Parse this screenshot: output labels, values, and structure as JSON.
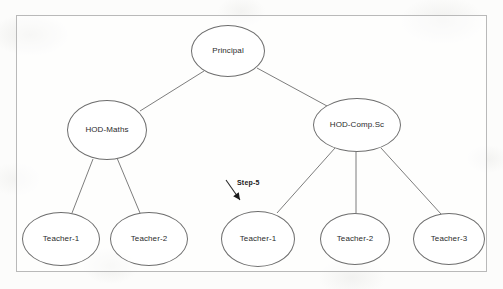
{
  "diagram": {
    "type": "organizational-hierarchy-tree",
    "frame": {
      "border_color": "#b9b9b9"
    },
    "node_style": {
      "stroke": "#6e6e6e",
      "fill": "#ffffff",
      "text_color": "#2b2b2b"
    },
    "edge_style": {
      "stroke": "#6e6e6e"
    },
    "nodes": [
      {
        "id": "principal",
        "label": "Principal",
        "level": 0,
        "cx": 228,
        "cy": 51,
        "rx": 37,
        "ry": 26
      },
      {
        "id": "hod-maths",
        "label": "HOD-Maths",
        "level": 1,
        "cx": 107,
        "cy": 130,
        "rx": 40,
        "ry": 30
      },
      {
        "id": "hod-comp-sc",
        "label": "HOD-Comp.Sc",
        "level": 1,
        "cx": 357,
        "cy": 125,
        "rx": 44,
        "ry": 27
      },
      {
        "id": "maths-teacher-1",
        "label": "Teacher-1",
        "level": 2,
        "cx": 61,
        "cy": 239,
        "rx": 39,
        "ry": 27
      },
      {
        "id": "maths-teacher-2",
        "label": "Teacher-2",
        "level": 2,
        "cx": 149,
        "cy": 239,
        "rx": 39,
        "ry": 27
      },
      {
        "id": "comp-teacher-1",
        "label": "Teacher-1",
        "level": 2,
        "cx": 258,
        "cy": 239,
        "rx": 37,
        "ry": 28
      },
      {
        "id": "comp-teacher-2",
        "label": "Teacher-2",
        "level": 2,
        "cx": 355,
        "cy": 239,
        "rx": 35,
        "ry": 26
      },
      {
        "id": "comp-teacher-3",
        "label": "Teacher-3",
        "level": 2,
        "cx": 449,
        "cy": 239,
        "rx": 36,
        "ry": 26
      }
    ],
    "edges": [
      {
        "from": "principal",
        "to": "hod-maths",
        "x1": 204,
        "y1": 71,
        "x2": 140,
        "y2": 111
      },
      {
        "from": "principal",
        "to": "hod-comp-sc",
        "x1": 257,
        "y1": 68,
        "x2": 327,
        "y2": 106
      },
      {
        "from": "hod-maths",
        "to": "maths-teacher-1",
        "x1": 93,
        "y1": 159,
        "x2": 72,
        "y2": 213
      },
      {
        "from": "hod-maths",
        "to": "maths-teacher-2",
        "x1": 117,
        "y1": 158,
        "x2": 140,
        "y2": 213
      },
      {
        "from": "hod-comp-sc",
        "to": "comp-teacher-1",
        "x1": 335,
        "y1": 148,
        "x2": 277,
        "y2": 213
      },
      {
        "from": "hod-comp-sc",
        "to": "comp-teacher-2",
        "x1": 356,
        "y1": 152,
        "x2": 356,
        "y2": 213
      },
      {
        "from": "hod-comp-sc",
        "to": "comp-teacher-3",
        "x1": 381,
        "y1": 148,
        "x2": 441,
        "y2": 214
      }
    ],
    "annotation": {
      "label": "Step-5",
      "target_node": "comp-teacher-1",
      "arrow": {
        "x1": 226,
        "y1": 180,
        "x2": 240,
        "y2": 200
      }
    }
  }
}
